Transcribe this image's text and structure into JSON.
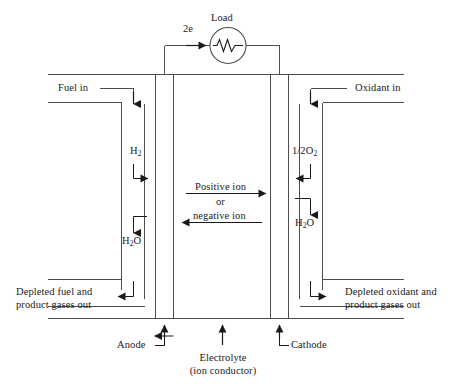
{
  "figure": {
    "stroke_color": "#4d4d4d",
    "text_color": "#1a1a1a",
    "background": "#ffffff"
  },
  "labels": {
    "load": "Load",
    "electrons": "2e",
    "fuel_in": "Fuel in",
    "oxidant_in": "Oxidant in",
    "hydrogen": "H",
    "hydrogen_sub": "2",
    "oxygen_frac": "1/2O",
    "oxygen_sub": "2",
    "water_left_a": "H",
    "water_left_sub": "2",
    "water_left_b": "O",
    "water_right_a": "H",
    "water_right_sub": "2",
    "water_right_b": "O",
    "positive_ion": "Positive ion",
    "or": "or",
    "negative_ion": "negative ion",
    "depleted_fuel_line1": "Depleted fuel and",
    "depleted_fuel_line2": "product gases out",
    "depleted_oxidant_line1": "Depleted oxidant and",
    "depleted_oxidant_line2": "product gases out",
    "anode": "Anode",
    "cathode": "Cathode",
    "electrolyte_line1": "Electrolyte",
    "electrolyte_line2": "(ion conductor)"
  }
}
